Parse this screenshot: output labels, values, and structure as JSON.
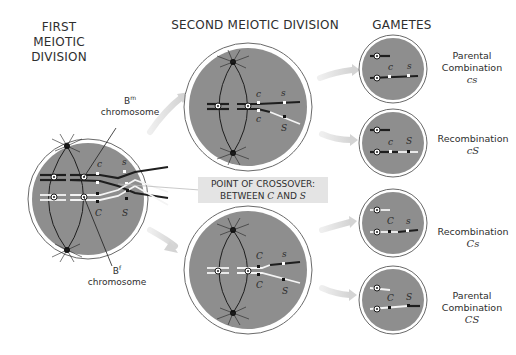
{
  "headings": {
    "first": [
      "FIRST",
      "MEIOTIC",
      "DIVISION"
    ],
    "second": "SECOND MEIOTIC DIVISION",
    "gametes": "GAMETES"
  },
  "labels": {
    "bm_chromosome": {
      "base": "B",
      "sup": "m",
      "word": "chromosome"
    },
    "bf_chromosome": {
      "base": "B",
      "sup": "f",
      "word": "chromosome"
    },
    "crossover": {
      "line1": "POINT OF CROSSOVER:",
      "line2_prefix": "BETWEEN ",
      "gene1": "C",
      "mid": " AND ",
      "gene2": "S"
    }
  },
  "genes": {
    "c_lower": "c",
    "s_lower": "s",
    "C_upper": "C",
    "S_upper": "S"
  },
  "gametes": [
    {
      "type": "Parental",
      "type2": "Combination",
      "genotype": "cs"
    },
    {
      "type": "Recombination",
      "type2": "",
      "genotype": "cS"
    },
    {
      "type": "Recombination",
      "type2": "",
      "genotype": "Cs"
    },
    {
      "type": "Parental",
      "type2": "Combination",
      "genotype": "CS"
    }
  ],
  "colors": {
    "cell_fill": "#8e8e8e",
    "cell_ring": "#ffffff",
    "cell_outline": "#6a6a6a",
    "dark_chromosome": "#1e1e1e",
    "light_chromosome": "#f4f4f4",
    "arrow": "#dcdcdc",
    "label_bg": "#e4e4e4"
  }
}
